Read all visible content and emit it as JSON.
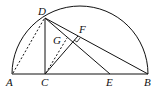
{
  "diagram": {
    "type": "geometry",
    "stroke_color": "#111111",
    "background": "#ffffff",
    "points": {
      "A": {
        "label": "A",
        "x": 12,
        "y": 74
      },
      "B": {
        "label": "B",
        "x": 148,
        "y": 74
      },
      "C": {
        "label": "C",
        "x": 45,
        "y": 74
      },
      "D": {
        "label": "D",
        "x": 45,
        "y": 18
      },
      "E": {
        "label": "E",
        "x": 110,
        "y": 74
      },
      "F": {
        "label": "F",
        "x": 78,
        "y": 35
      },
      "G": {
        "label": "G",
        "x": 68,
        "y": 37
      }
    },
    "segments": [
      {
        "from": "A",
        "to": "B",
        "style": "solid"
      },
      {
        "from": "D",
        "to": "C",
        "style": "solid"
      },
      {
        "from": "D",
        "to": "B",
        "style": "solid"
      },
      {
        "from": "D",
        "to": "E",
        "style": "solid"
      },
      {
        "from": "C",
        "to": "F",
        "style": "solid"
      },
      {
        "from": "A",
        "to": "D",
        "style": "dashed"
      },
      {
        "from": "C",
        "to": "G",
        "style": "dashed"
      }
    ],
    "arc": {
      "center": "midpoint of AB",
      "label": "semicircle"
    },
    "right_angle_marks": [
      "F"
    ]
  }
}
